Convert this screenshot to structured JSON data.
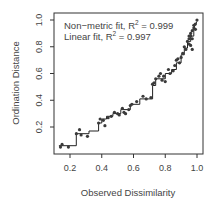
{
  "chart_data": {
    "type": "scatter",
    "title": "",
    "xlabel": "Observed Dissimilarity",
    "ylabel": "Ordination Distance",
    "xlim": [
      0.12,
      1.02
    ],
    "ylim": [
      0.02,
      1.02
    ],
    "xticks": [
      "0.2",
      "0.4",
      "0.6",
      "0.8",
      "1.0"
    ],
    "xtick_values": [
      0.2,
      0.4,
      0.6,
      0.8,
      1.0
    ],
    "yticks": [
      "0.2",
      "0.4",
      "0.6",
      "0.8",
      "1.0"
    ],
    "ytick_values": [
      0.2,
      0.4,
      0.6,
      0.8,
      1.0
    ],
    "grid": false,
    "annotations": [
      {
        "label": "Non−metric fit, R",
        "sup": "2",
        "value": " = 0.999"
      },
      {
        "label": "Linear fit, R",
        "sup": "2",
        "value": " = 0.997"
      }
    ],
    "points": {
      "x": [
        0.14,
        0.15,
        0.19,
        0.24,
        0.26,
        0.27,
        0.31,
        0.38,
        0.39,
        0.41,
        0.42,
        0.44,
        0.46,
        0.48,
        0.5,
        0.51,
        0.53,
        0.54,
        0.55,
        0.57,
        0.58,
        0.59,
        0.62,
        0.66,
        0.68,
        0.71,
        0.72,
        0.73,
        0.74,
        0.76,
        0.77,
        0.78,
        0.79,
        0.8,
        0.82,
        0.83,
        0.85,
        0.86,
        0.87,
        0.88,
        0.89,
        0.9,
        0.91,
        0.92,
        0.93,
        0.94,
        0.95,
        0.95,
        0.96,
        0.96,
        0.97,
        0.97,
        0.98,
        0.98,
        0.99,
        0.99,
        1.0,
        0.97,
        0.96,
        0.95
      ],
      "y": [
        0.05,
        0.07,
        0.05,
        0.15,
        0.18,
        0.14,
        0.13,
        0.23,
        0.26,
        0.25,
        0.21,
        0.27,
        0.28,
        0.31,
        0.3,
        0.29,
        0.34,
        0.31,
        0.3,
        0.33,
        0.36,
        0.37,
        0.39,
        0.43,
        0.41,
        0.42,
        0.52,
        0.53,
        0.56,
        0.58,
        0.6,
        0.55,
        0.58,
        0.54,
        0.63,
        0.6,
        0.62,
        0.66,
        0.7,
        0.71,
        0.68,
        0.72,
        0.75,
        0.8,
        0.78,
        0.84,
        0.82,
        0.86,
        0.88,
        0.9,
        0.92,
        0.86,
        0.94,
        0.96,
        0.97,
        0.93,
        1.0,
        0.78,
        0.81,
        0.88
      ]
    },
    "step_fit": {
      "x": [
        0.13,
        0.24,
        0.24,
        0.32,
        0.32,
        0.38,
        0.38,
        0.4,
        0.4,
        0.43,
        0.43,
        0.47,
        0.47,
        0.52,
        0.52,
        0.58,
        0.58,
        0.64,
        0.64,
        0.72,
        0.72,
        0.74,
        0.74,
        0.8,
        0.8,
        0.84,
        0.84,
        0.87,
        0.87,
        0.9,
        0.9,
        0.92,
        0.92,
        0.94,
        0.94,
        0.96,
        0.96,
        0.98,
        0.98,
        1.0
      ],
      "y": [
        0.06,
        0.06,
        0.15,
        0.15,
        0.17,
        0.17,
        0.23,
        0.23,
        0.26,
        0.26,
        0.28,
        0.28,
        0.3,
        0.3,
        0.33,
        0.33,
        0.37,
        0.37,
        0.41,
        0.41,
        0.51,
        0.51,
        0.56,
        0.56,
        0.6,
        0.6,
        0.63,
        0.63,
        0.68,
        0.68,
        0.74,
        0.74,
        0.79,
        0.79,
        0.84,
        0.84,
        0.88,
        0.88,
        0.94,
        0.99
      ]
    },
    "colors": {
      "points": "#3a3a3a",
      "line": "#222222",
      "axis": "#333333",
      "text": "#444444"
    }
  }
}
